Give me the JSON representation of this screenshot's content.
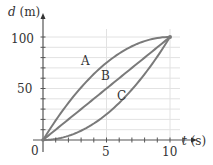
{
  "chart_data": {
    "type": "line",
    "title": "",
    "xlabel": "t (s)",
    "ylabel": "d (m)",
    "xlim": [
      0,
      10
    ],
    "ylim": [
      0,
      100
    ],
    "x_ticks": [
      0,
      5,
      10
    ],
    "y_ticks": [
      50,
      100
    ],
    "x_tick_labels": [
      "0",
      "5",
      "10"
    ],
    "y_tick_labels": [
      "50",
      "100"
    ],
    "origin_label": "0",
    "grid": true,
    "grid_y_step": 10,
    "grid_x_step": 5,
    "series": [
      {
        "name": "A",
        "description": "concave down (decelerating)",
        "x": [
          0,
          2,
          4,
          6,
          8,
          10
        ],
        "values": [
          0,
          36,
          64,
          84,
          96,
          100
        ]
      },
      {
        "name": "B",
        "description": "straight line (constant velocity)",
        "x": [
          0,
          2,
          4,
          6,
          8,
          10
        ],
        "values": [
          0,
          20,
          40,
          60,
          80,
          100
        ]
      },
      {
        "name": "C",
        "description": "concave up (accelerating)",
        "x": [
          0,
          2,
          4,
          6,
          8,
          10
        ],
        "values": [
          0,
          4,
          16,
          36,
          64,
          100
        ]
      }
    ],
    "annotations": [
      {
        "text": "A",
        "x": 3.0,
        "y": 78
      },
      {
        "text": "B",
        "x": 4.9,
        "y": 63
      },
      {
        "text": "C",
        "x": 6.1,
        "y": 43
      }
    ]
  },
  "labels": {
    "y_axis_title_var": "d",
    "y_axis_title_unit": " (m)",
    "x_axis_title_var": "t",
    "x_axis_title_unit": " (s)",
    "curve_a": "A",
    "curve_b": "B",
    "curve_c": "C",
    "tick_0": "0",
    "tick_x5": "5",
    "tick_x10": "10",
    "tick_y50": "50",
    "tick_y100": "100"
  },
  "colors": {
    "curve": "#7a7a7a",
    "axis": "#555555",
    "grid": "#e2e2e2",
    "text": "#333333"
  }
}
